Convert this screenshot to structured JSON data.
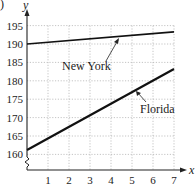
{
  "panel_label": ")",
  "chart_data": {
    "type": "line",
    "title": "",
    "xlabel": "x",
    "ylabel": "y",
    "x": [
      0,
      1,
      2,
      3,
      4,
      5,
      6,
      7
    ],
    "x_ticks": [
      "1",
      "2",
      "3",
      "4",
      "5",
      "6",
      "7"
    ],
    "y_ticks": [
      "160",
      "165",
      "170",
      "175",
      "180",
      "185",
      "190",
      "195"
    ],
    "xlim": [
      0,
      7
    ],
    "ylim": [
      158,
      196
    ],
    "y_axis_break": true,
    "grid": true,
    "grid_style": "dotted",
    "series": [
      {
        "name": "New York",
        "x": [
          0,
          7
        ],
        "values": [
          190,
          193.3
        ],
        "label_pos": {
          "x": 2.4,
          "y": 186.5
        }
      },
      {
        "name": "Florida",
        "x": [
          0,
          7
        ],
        "values": [
          161.2,
          183.2
        ],
        "label_pos": {
          "x": 5.6,
          "y": 174.0
        }
      }
    ],
    "legend": "inline annotations with arrows"
  }
}
